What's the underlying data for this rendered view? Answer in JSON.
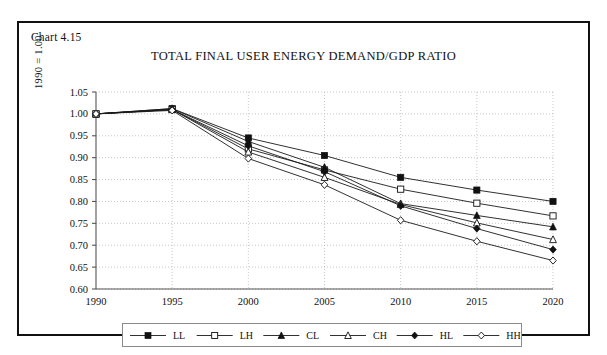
{
  "figure": {
    "chart_number": "Chart 4.15",
    "title": "TOTAL FINAL USER ENERGY DEMAND/GDP RATIO"
  },
  "axes": {
    "y_label": "1990 = 1.00",
    "y_ticks": [
      "0.60",
      "0.65",
      "0.70",
      "0.75",
      "0.80",
      "0.85",
      "0.90",
      "0.95",
      "1.00",
      "1.05"
    ],
    "x_ticks": [
      "1990",
      "1995",
      "2000",
      "2005",
      "2010",
      "2015",
      "2020"
    ]
  },
  "legend": {
    "items": [
      {
        "label": "LL",
        "marker": "filled-square"
      },
      {
        "label": "LH",
        "marker": "open-square"
      },
      {
        "label": "CL",
        "marker": "filled-triangle"
      },
      {
        "label": "CH",
        "marker": "open-triangle"
      },
      {
        "label": "HL",
        "marker": "filled-diamond"
      },
      {
        "label": "HH",
        "marker": "open-diamond"
      }
    ]
  },
  "colors": {
    "ink": "#111111",
    "grid": "#b9b9b9",
    "axis": "#555555",
    "frame": "#111111",
    "background": "#ffffff"
  },
  "chart_data": {
    "type": "line",
    "title": "TOTAL FINAL USER ENERGY DEMAND/GDP RATIO",
    "xlabel": "",
    "ylabel": "1990 = 1.00",
    "x": [
      1990,
      1995,
      2000,
      2005,
      2010,
      2015,
      2020
    ],
    "xlim": [
      1990,
      2020
    ],
    "ylim": [
      0.6,
      1.05
    ],
    "ytick_step": 0.05,
    "grid": true,
    "legend_position": "bottom",
    "series": [
      {
        "name": "LL",
        "marker": "filled-square",
        "values": [
          1.0,
          1.012,
          0.945,
          0.905,
          0.855,
          0.826,
          0.8
        ]
      },
      {
        "name": "LH",
        "marker": "open-square",
        "values": [
          1.0,
          1.01,
          0.92,
          0.872,
          0.828,
          0.796,
          0.767
        ]
      },
      {
        "name": "CL",
        "marker": "filled-triangle",
        "values": [
          1.0,
          1.012,
          0.937,
          0.878,
          0.795,
          0.768,
          0.742
        ]
      },
      {
        "name": "CH",
        "marker": "open-triangle",
        "values": [
          1.0,
          1.01,
          0.913,
          0.855,
          0.793,
          0.751,
          0.713
        ]
      },
      {
        "name": "HL",
        "marker": "filled-diamond",
        "values": [
          1.0,
          1.01,
          0.927,
          0.868,
          0.79,
          0.738,
          0.69
        ]
      },
      {
        "name": "HH",
        "marker": "open-diamond",
        "values": [
          1.0,
          1.008,
          0.898,
          0.838,
          0.757,
          0.709,
          0.665
        ]
      }
    ]
  }
}
